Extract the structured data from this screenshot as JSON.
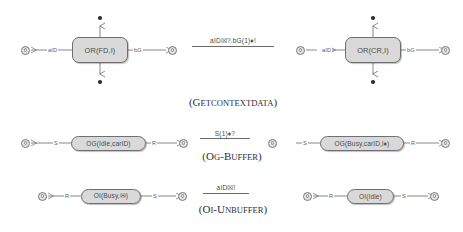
{
  "diagram": {
    "title_visible": false,
    "colors": {
      "box_fill": "#d9d9d9",
      "box_stroke": "#6f6f6f",
      "line": "#7a7a7a",
      "text": "#4a4a4a",
      "caption": "#2f2f2f",
      "background": "#ffffff"
    },
    "rows": [
      {
        "id": "row-getcontextdata",
        "caption": "(GETCONTEXTDATA)",
        "caption_first": "G",
        "caption_rest": "ET",
        "caption_parts": [
          "(",
          "G",
          "ET",
          "C",
          "ONTEXT",
          "D",
          "ATA",
          ")"
        ],
        "transition_label": "aID☒?.bG(1)♦!",
        "left": {
          "box_label": "OR(FD,I)",
          "in_label": "aID",
          "out_label": "bG",
          "has_vertical_arrows": true,
          "top_terminal": "filled-dot",
          "bottom_terminal": "filled-dot"
        },
        "right": {
          "box_label": "OR(CR,I)",
          "in_label": "aID",
          "out_label": "bG",
          "has_vertical_arrows": true,
          "top_terminal": "filled-dot",
          "bottom_terminal": "filled-dot"
        }
      },
      {
        "id": "row-og-buffer",
        "caption": "(OG-BUFFER)",
        "caption_parts": [
          "(OG-",
          "B",
          "UFFER",
          ")"
        ],
        "transition_label": "S(1)♦?",
        "left": {
          "box_label": "OG(Idle,carID)",
          "in_label": "S",
          "out_label": "R",
          "has_vertical_arrows": false
        },
        "right": {
          "box_label": "OG(Busy,carID,l♦)",
          "in_label": "S",
          "out_label": "R",
          "has_vertical_arrows": false
        }
      },
      {
        "id": "row-oi-unbuffer",
        "caption": "(OI-UNBUFFER)",
        "caption_parts": [
          "(OI-U",
          "N",
          "B",
          "UFFER",
          ")"
        ],
        "transition_label": "aID☒!",
        "left": {
          "box_label": "OI(Busy,✉)",
          "in_label": "R",
          "out_label": "S",
          "has_vertical_arrows": false
        },
        "right": {
          "box_label": "OI(Idle)",
          "in_label": "R",
          "out_label": "S",
          "has_vertical_arrows": false
        }
      }
    ]
  }
}
